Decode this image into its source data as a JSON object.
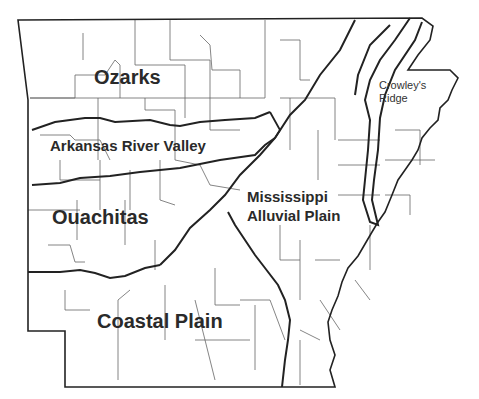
{
  "map": {
    "subject": "Arkansas physiographic regions",
    "colors": {
      "background": "#ffffff",
      "county_lines": "#555555",
      "region_lines": "#222222",
      "text": "#2a2a2a"
    },
    "regions": [
      {
        "id": "ozarks",
        "label": "Ozarks"
      },
      {
        "id": "arkansas-river-valley",
        "label": "Arkansas River Valley"
      },
      {
        "id": "ouachitas",
        "label": "Ouachitas"
      },
      {
        "id": "coastal-plain",
        "label": "Coastal Plain"
      },
      {
        "id": "mississippi-alluvial-plain",
        "label_line1": "Mississippi",
        "label_line2": "Alluvial Plain"
      },
      {
        "id": "crowleys-ridge",
        "label_line1": "Crowley's",
        "label_line2": "Ridge"
      }
    ]
  }
}
